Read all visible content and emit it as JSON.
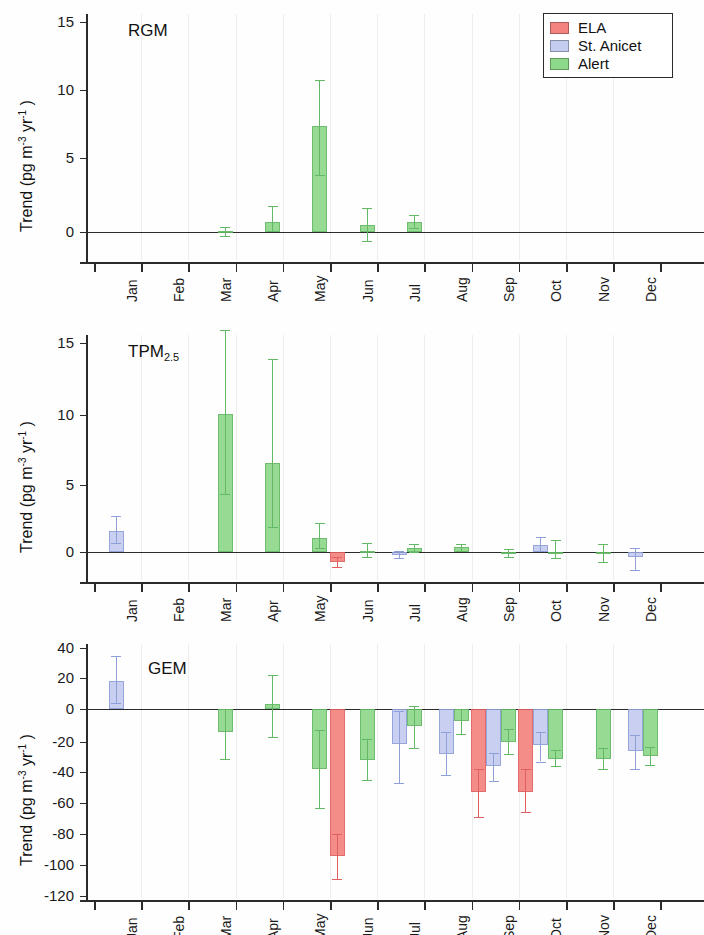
{
  "figure": {
    "width": 704,
    "height": 935,
    "ylabel": "Trend (pg m-3 yr-1)",
    "ylabel_parts": {
      "main": "Trend (pg m",
      "sup1": "-3",
      "mid": " yr",
      "sup2": "-1",
      "tail": " )"
    }
  },
  "legend": {
    "position": "top-right",
    "entries": [
      {
        "label": "ELA",
        "color": "#f4837f"
      },
      {
        "label": "St. Anicet",
        "color": "#c4ccf0"
      },
      {
        "label": "Alert",
        "color": "#8ed88a"
      }
    ]
  },
  "colors": {
    "ELA": "#f4837f",
    "St. Anicet": "#c4ccf0",
    "Alert": "#8ed88a",
    "ELA_edge": "#e06060",
    "StAnicet_edge": "#8f9fd8",
    "Alert_edge": "#62b863",
    "axis": "#2b2b2b",
    "grid": "#ededed"
  },
  "months": [
    "Jan",
    "Feb",
    "Mar",
    "Apr",
    "May",
    "Jun",
    "Jul",
    "Aug",
    "Sep",
    "Oct",
    "Nov",
    "Dec"
  ],
  "chart_data": [
    {
      "type": "bar",
      "title": "RGM",
      "panel_index": 0,
      "xlabel": "",
      "ylabel": "Trend (pg m-3 yr-1)",
      "ylim": [
        -2.5,
        16
      ],
      "yticks": [
        0,
        5,
        10,
        15
      ],
      "categories": [
        "Jan",
        "Feb",
        "Mar",
        "Apr",
        "May",
        "Jun",
        "Jul",
        "Aug",
        "Sep",
        "Oct",
        "Nov",
        "Dec"
      ],
      "grid": false,
      "legend_position": "top-right",
      "series": [
        {
          "name": "ELA",
          "values": [
            null,
            null,
            null,
            null,
            null,
            null,
            null,
            null,
            null,
            null,
            null,
            null
          ],
          "err_low": [
            null,
            null,
            null,
            null,
            null,
            null,
            null,
            null,
            null,
            null,
            null,
            null
          ],
          "err_high": [
            null,
            null,
            null,
            null,
            null,
            null,
            null,
            null,
            null,
            null,
            null,
            null
          ]
        },
        {
          "name": "St. Anicet",
          "values": [
            null,
            null,
            null,
            null,
            null,
            null,
            null,
            null,
            null,
            null,
            null,
            null
          ],
          "err_low": [
            null,
            null,
            null,
            null,
            null,
            null,
            null,
            null,
            null,
            null,
            null,
            null
          ],
          "err_high": [
            null,
            null,
            null,
            null,
            null,
            null,
            null,
            null,
            null,
            null,
            null,
            null
          ]
        },
        {
          "name": "Alert",
          "values": [
            null,
            null,
            0.05,
            0.65,
            7.35,
            0.45,
            0.65,
            null,
            null,
            null,
            null,
            null
          ],
          "err_low": [
            null,
            null,
            -0.25,
            0.1,
            3.85,
            -0.6,
            0.25,
            null,
            null,
            null,
            null,
            null
          ],
          "err_high": [
            null,
            null,
            0.35,
            1.75,
            10.75,
            1.6,
            1.15,
            null,
            null,
            null,
            null,
            null
          ]
        }
      ]
    },
    {
      "type": "bar",
      "title": "TPM2.5",
      "title_base": "TPM",
      "title_sub": "2.5",
      "panel_index": 1,
      "xlabel": "",
      "ylabel": "Trend (pg m-3 yr-1)",
      "ylim": [
        -2.5,
        16.5
      ],
      "yticks": [
        0,
        5,
        10,
        15
      ],
      "categories": [
        "Jan",
        "Feb",
        "Mar",
        "Apr",
        "May",
        "Jun",
        "Jul",
        "Aug",
        "Sep",
        "Oct",
        "Nov",
        "Dec"
      ],
      "grid": false,
      "legend_position": "none",
      "series": [
        {
          "name": "ELA",
          "values": [
            null,
            null,
            null,
            null,
            null,
            -0.75,
            null,
            null,
            null,
            null,
            null,
            null
          ],
          "err_low": [
            null,
            null,
            null,
            null,
            null,
            -1.15,
            null,
            null,
            null,
            null,
            null,
            null
          ],
          "err_high": [
            null,
            null,
            null,
            null,
            null,
            -0.35,
            null,
            null,
            null,
            null,
            null,
            null
          ]
        },
        {
          "name": "St. Anicet",
          "values": [
            1.55,
            null,
            null,
            null,
            null,
            null,
            -0.25,
            null,
            null,
            0.5,
            null,
            -0.4
          ],
          "err_low": [
            0.7,
            null,
            null,
            null,
            null,
            null,
            -0.45,
            null,
            null,
            0.05,
            null,
            -1.35
          ],
          "err_high": [
            2.65,
            null,
            null,
            null,
            null,
            null,
            0.05,
            null,
            null,
            1.1,
            null,
            0.3
          ]
        },
        {
          "name": "Alert",
          "values": [
            null,
            null,
            10.1,
            6.6,
            1.05,
            0.05,
            0.3,
            0.35,
            -0.05,
            0.0,
            -0.05,
            null
          ],
          "err_low": [
            null,
            null,
            4.3,
            1.9,
            0.3,
            -0.35,
            0.0,
            0.1,
            -0.35,
            -0.45,
            -0.75,
            null
          ],
          "err_high": [
            null,
            null,
            15.9,
            13.9,
            2.2,
            0.7,
            0.6,
            0.6,
            0.2,
            0.9,
            0.6,
            null
          ]
        }
      ]
    },
    {
      "type": "bar",
      "title": "GEM",
      "panel_index": 2,
      "xlabel": "",
      "ylabel": "Trend (pg m-3 yr-1)",
      "ylim": [
        -120,
        40
      ],
      "yticks": [
        -120,
        -100,
        -80,
        -60,
        -40,
        -20,
        0,
        20,
        40
      ],
      "categories": [
        "Jan",
        "Feb",
        "Mar",
        "Apr",
        "May",
        "Jun",
        "Jul",
        "Aug",
        "Sep",
        "Oct",
        "Nov",
        "Dec"
      ],
      "grid": false,
      "legend_position": "none",
      "series": [
        {
          "name": "ELA",
          "values": [
            null,
            null,
            null,
            null,
            null,
            -94,
            null,
            null,
            -53,
            -53,
            null,
            null
          ],
          "err_low": [
            null,
            null,
            null,
            null,
            null,
            -109,
            null,
            null,
            -69,
            -66,
            null,
            null
          ],
          "err_high": [
            null,
            null,
            null,
            null,
            null,
            -80,
            null,
            null,
            -38,
            -38,
            null,
            null
          ]
        },
        {
          "name": "St. Anicet",
          "values": [
            18,
            null,
            null,
            null,
            null,
            null,
            -21,
            -28,
            -36,
            -22,
            null,
            -26
          ],
          "err_low": [
            4,
            null,
            null,
            null,
            null,
            null,
            -47,
            -42,
            -46,
            -33,
            null,
            -38
          ],
          "err_high": [
            35,
            null,
            null,
            null,
            null,
            null,
            -1,
            -14,
            -27,
            -14,
            null,
            -16
          ]
        },
        {
          "name": "Alert",
          "values": [
            null,
            null,
            -14,
            3,
            -38,
            -32,
            -10,
            -7,
            -20,
            -31,
            -31,
            -29
          ],
          "err_low": [
            null,
            null,
            -31,
            -17,
            -63,
            -45,
            -24,
            -15,
            -28,
            -36,
            -38,
            -35
          ],
          "err_high": [
            null,
            null,
            0,
            22,
            -13,
            -18,
            2,
            0,
            -12,
            -25,
            -24,
            -23
          ]
        }
      ]
    }
  ]
}
